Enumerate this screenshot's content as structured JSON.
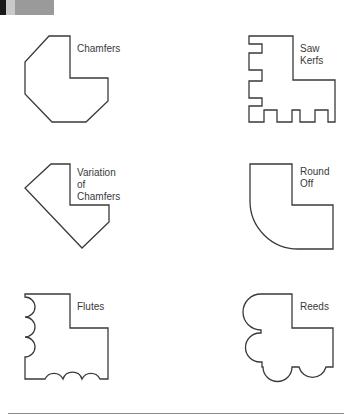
{
  "header_strip": {
    "segments": [
      {
        "color": "#1a1a1a",
        "width": 6
      },
      {
        "color": "#c9c9c9",
        "width": 9
      },
      {
        "color": "#9a9a9a",
        "width": 39
      }
    ]
  },
  "shapes": [
    {
      "id": "chamfers",
      "label_lines": [
        "Chamfers"
      ]
    },
    {
      "id": "saw-kerfs",
      "label_lines": [
        "Saw",
        "Kerfs"
      ]
    },
    {
      "id": "variation-of-chamfers",
      "label_lines": [
        "Variation",
        "of",
        "Chamfers"
      ]
    },
    {
      "id": "round-off",
      "label_lines": [
        "Round",
        "Off"
      ]
    },
    {
      "id": "flutes",
      "label_lines": [
        "Flutes"
      ]
    },
    {
      "id": "reeds",
      "label_lines": [
        "Reeds"
      ]
    }
  ],
  "colors": {
    "stroke": "#3a3a3a",
    "rule": "#8a8a8a"
  }
}
